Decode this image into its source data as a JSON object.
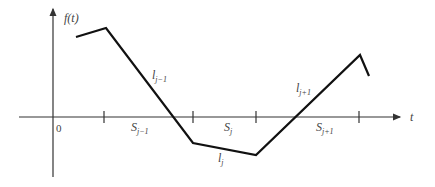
{
  "diagram": {
    "y_axis_label": "f(t)",
    "x_axis_label": "t",
    "origin_label": "0",
    "segment_labels": {
      "l_j_minus_1": "l",
      "l_j_minus_1_sub": "j−1",
      "l_j": "l",
      "l_j_sub": "j",
      "l_j_plus_1": "l",
      "l_j_plus_1_sub": "j+1"
    },
    "interval_labels": {
      "s_j_minus_1": "S",
      "s_j_minus_1_sub": "j−1",
      "s_j": "S",
      "s_j_sub": "j",
      "s_j_plus_1": "S",
      "s_j_plus_1_sub": "j+1"
    },
    "colors": {
      "curve": "#111111",
      "axis": "#333333",
      "text": "#444444"
    }
  }
}
